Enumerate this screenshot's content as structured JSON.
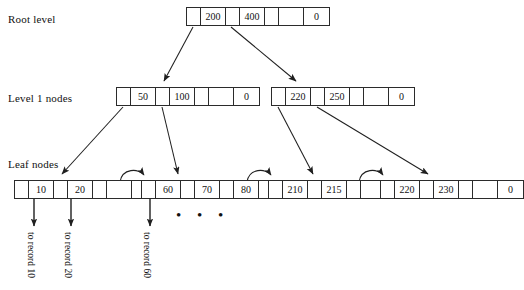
{
  "diagram": {
    "row_labels": [
      {
        "name": "root",
        "text": "Root level"
      },
      {
        "name": "level1",
        "text": "Level 1 nodes"
      },
      {
        "name": "leaf",
        "text": "Leaf nodes"
      }
    ],
    "nodes": {
      "root": {
        "id": "root",
        "cells": [
          "",
          "200",
          "",
          "400",
          "",
          "",
          "0"
        ]
      },
      "level1_left": {
        "id": "level1-left",
        "cells": [
          "",
          "50",
          "",
          "100",
          "",
          "",
          "0"
        ]
      },
      "level1_right": {
        "id": "level1-right",
        "cells": [
          "",
          "220",
          "",
          "250",
          "",
          "",
          "0"
        ]
      },
      "leaf_0": {
        "id": "leaf-0",
        "cells": [
          "",
          "10",
          "",
          "20",
          "",
          "",
          ""
        ]
      },
      "leaf_1": {
        "id": "leaf-1",
        "cells": [
          "",
          "60",
          "",
          "70",
          "",
          "80",
          ""
        ]
      },
      "leaf_2": {
        "id": "leaf-2",
        "cells": [
          "",
          "210",
          "",
          "215",
          "",
          "",
          ""
        ]
      },
      "leaf_3": {
        "id": "leaf-3",
        "cells": [
          "",
          "220",
          "",
          "230",
          "",
          "",
          "0"
        ]
      }
    },
    "record_pointers": [
      {
        "name": "to-record-10",
        "text": "to record 10"
      },
      {
        "name": "to-record-20",
        "text": "to record 20"
      },
      {
        "name": "to-record-60",
        "text": "to record 60"
      }
    ],
    "ellipsis": "• • •",
    "colors": {
      "stroke": "#2b2b2b",
      "text": "#111111",
      "background": "#ffffff"
    }
  }
}
